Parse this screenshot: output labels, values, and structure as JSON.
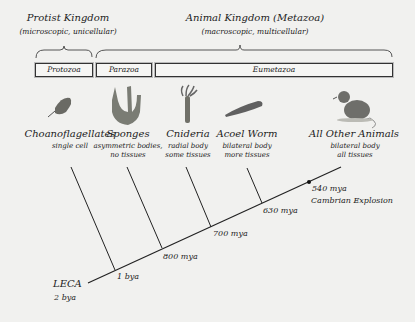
{
  "kingdoms": [
    {
      "title": "Protist Kingdom",
      "subtitle": "(microscopic, unicellular)"
    },
    {
      "title": "Animal Kingdom (Metazoa)",
      "subtitle": "(macroscopic, multicellular)"
    }
  ],
  "groups": [
    {
      "label": "Protozoa"
    },
    {
      "label": "Parazoa"
    },
    {
      "label": "Eumetazoa"
    }
  ],
  "taxa": [
    {
      "name": "Choanoflagellates",
      "desc1": "single cell",
      "desc2": "",
      "icon": "choanoflagellate-icon"
    },
    {
      "name": "Sponges",
      "desc1": "asymmetric bodies,",
      "desc2": "no tissues",
      "icon": "sponge-icon"
    },
    {
      "name": "Cnideria",
      "desc1": "radial body",
      "desc2": "some tissues",
      "icon": "cnidarian-icon"
    },
    {
      "name": "Acoel Worm",
      "desc1": "bilateral body",
      "desc2": "more tissues",
      "icon": "acoel-worm-icon"
    },
    {
      "name": "All Other Animals",
      "desc1": "bilateral body",
      "desc2": "all tissues",
      "icon": "rat-icon"
    }
  ],
  "dates": {
    "leca_name": "LECA",
    "leca_age": "2 bya",
    "node1": "1 bya",
    "node2": "800 mya",
    "node3": "700 mya",
    "node4": "630 mya",
    "cambrian_age": "540 mya",
    "cambrian_label": "Cambrian Explosion"
  }
}
